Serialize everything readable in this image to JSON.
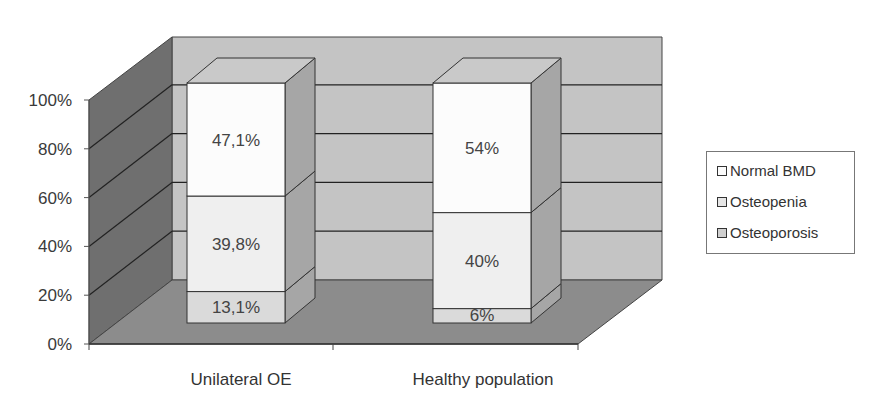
{
  "chart_data": {
    "type": "bar",
    "subtype": "stacked-100-3d",
    "title": "",
    "xlabel": "",
    "ylabel": "",
    "ylim": [
      0,
      100
    ],
    "yticks": [
      "0%",
      "20%",
      "40%",
      "60%",
      "80%",
      "100%"
    ],
    "categories": [
      "Unilateral OE",
      "Healthy population"
    ],
    "series": [
      {
        "name": "Osteoporosis",
        "values": [
          13.1,
          6
        ],
        "labels": [
          "13,1%",
          "6%"
        ],
        "color": "#d9d9d9"
      },
      {
        "name": "Osteopenia",
        "values": [
          39.8,
          40
        ],
        "labels": [
          "39,8%",
          "40%"
        ],
        "color": "#ededed"
      },
      {
        "name": "Normal BMD",
        "values": [
          47.1,
          54
        ],
        "labels": [
          "47,1%",
          "54%"
        ],
        "color": "#fbfbfb"
      }
    ],
    "grid": true,
    "legend_position": "right",
    "legend": [
      "Normal BMD",
      "Osteopenia",
      "Osteoporosis"
    ]
  },
  "colors": {
    "back_wall": "#c4c4c4",
    "side_wall": "#6f6f6f",
    "floor": "#8c8c8c",
    "bar_side": "#a6a6a6",
    "bar_top": "#c9c9c9",
    "gridline": "#222222"
  }
}
